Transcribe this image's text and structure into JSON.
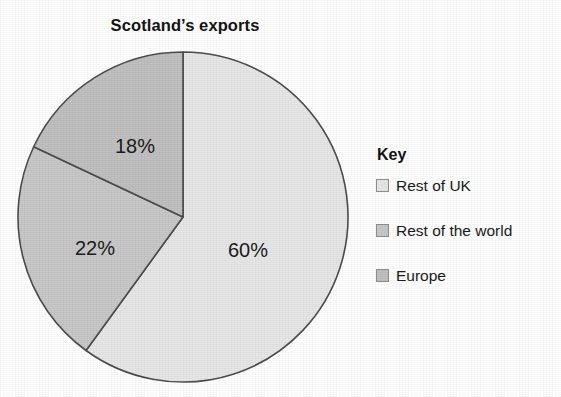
{
  "chart_data": {
    "type": "pie",
    "title": "Scotland’s exports",
    "xlabel": "",
    "ylabel": "",
    "legend_position": "right",
    "grid": false,
    "start_angle_deg": 0,
    "direction": "clockwise",
    "categories": [
      "Rest of UK",
      "Rest of the world",
      "Europe"
    ],
    "values": [
      60,
      22,
      18
    ],
    "value_labels": [
      "60%",
      "22%",
      "18%"
    ],
    "colors": [
      "#e7e7e7",
      "#c8c8c8",
      "#c0c0c0"
    ],
    "slices": [
      {
        "label": "Rest of UK",
        "value": 60,
        "value_label": "60%",
        "color": "#e7e7e7",
        "start_deg": 0,
        "end_deg": 216
      },
      {
        "label": "Rest of the world",
        "value": 22,
        "value_label": "22%",
        "color": "#c8c8c8",
        "start_deg": 216,
        "end_deg": 295.2
      },
      {
        "label": "Europe",
        "value": 18,
        "value_label": "18%",
        "color": "#c0c0c0",
        "start_deg": 295.2,
        "end_deg": 360
      }
    ]
  },
  "legend": {
    "title": "Key",
    "items": [
      {
        "label": "Rest of UK",
        "color": "#e7e7e7"
      },
      {
        "label": "Rest of the world",
        "color": "#c8c8c8"
      },
      {
        "label": "Europe",
        "color": "#c0c0c0"
      }
    ]
  },
  "style": {
    "outline_color": "#4d4d4d",
    "text_color": "#1b1b1b",
    "background": "#ffffff"
  }
}
